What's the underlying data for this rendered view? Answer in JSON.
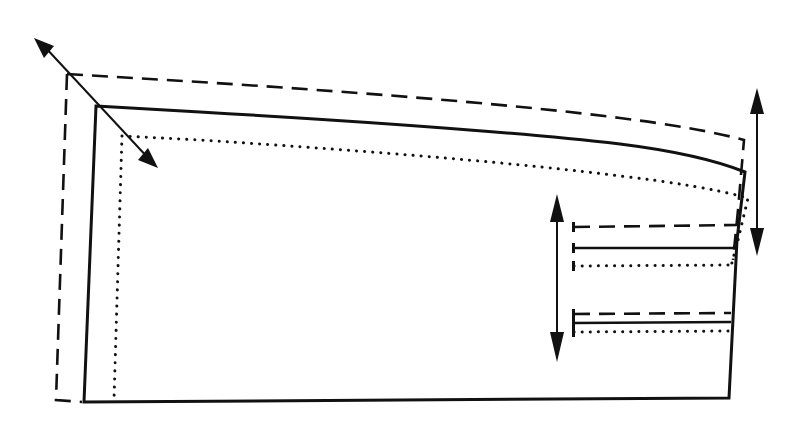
{
  "diagram": {
    "title": "",
    "type": "pattern-grading-diagram",
    "legend": [],
    "line_styles": {
      "base_size": "solid",
      "larger_size": "dashed",
      "smaller_size": "dotted"
    },
    "colors": {
      "stroke": "#111111",
      "background": "#ffffff"
    },
    "elements": [
      {
        "id": "outline-solid",
        "style": "solid",
        "description": "base pattern piece outline"
      },
      {
        "id": "outline-dashed",
        "style": "dashed",
        "description": "graded-up outline"
      },
      {
        "id": "outline-dotted",
        "style": "dotted",
        "description": "graded-down outline"
      },
      {
        "id": "corner-arrow",
        "style": "double-arrow",
        "description": "diagonal grading direction at top-left corner"
      },
      {
        "id": "right-edge-arrow",
        "style": "double-arrow",
        "description": "vertical grading direction at right edge"
      },
      {
        "id": "dart-arrow",
        "style": "double-arrow",
        "description": "vertical grading direction for dart lines"
      },
      {
        "id": "dart-lines-upper",
        "style": "solid/dashed/dotted",
        "description": "upper set of horizontal dart legs"
      },
      {
        "id": "dart-lines-lower",
        "style": "solid/dashed/dotted",
        "description": "lower set of horizontal dart legs"
      }
    ]
  }
}
